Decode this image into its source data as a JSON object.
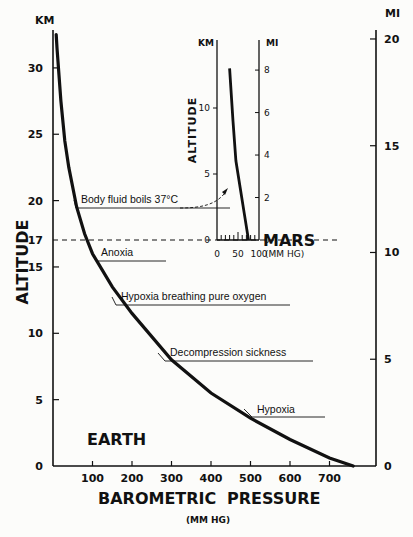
{
  "chart_data": {
    "type": "line",
    "title": "",
    "xlabel": "BAROMETRIC PRESSURE",
    "xlabel_units": "(MM HG)",
    "ylabel": "ALTITUDE",
    "ylabel_left_units": "KM",
    "ylabel_right_units": "MI",
    "xlim": [
      0,
      780
    ],
    "ylim_km": [
      0,
      33
    ],
    "x_ticks": [
      100,
      200,
      300,
      400,
      500,
      600,
      700
    ],
    "y_ticks_km": [
      0,
      5,
      10,
      15,
      17,
      20,
      25,
      30
    ],
    "y_ticks_mi": [
      0,
      5,
      10,
      15,
      20
    ],
    "grid": false,
    "legend": "none",
    "series": [
      {
        "name": "Earth",
        "x": [
          760,
          700,
          600,
          500,
          400,
          300,
          200,
          150,
          100,
          80,
          60,
          40,
          30,
          20,
          10,
          8
        ],
        "y": [
          0,
          0.6,
          2.0,
          3.6,
          5.5,
          8.0,
          11.5,
          13.5,
          16.0,
          17.5,
          19.5,
          22.5,
          24.5,
          27.5,
          31.5,
          32.5
        ]
      },
      {
        "name": "Mars",
        "x": [
          75,
          65,
          55,
          45,
          38,
          30
        ],
        "y": [
          0,
          2,
          4,
          6,
          9,
          13
        ]
      }
    ],
    "reference_lines": [
      {
        "label": "17",
        "orientation": "horizontal",
        "y_km": 17,
        "style": "dashed"
      }
    ],
    "annotations": [
      {
        "text": "Body fluid boils 37°C",
        "y_km": 19.3
      },
      {
        "text": "Anoxia",
        "y_km": 15.5
      },
      {
        "text": "Hypoxia breathing pure oxygen",
        "y_km": 12.2
      },
      {
        "text": "Decompression sickness",
        "y_km": 7.9
      },
      {
        "text": "Hypoxia",
        "y_km": 3.5
      }
    ],
    "region_labels": [
      "EARTH",
      "MARS"
    ],
    "inset": {
      "title": "Mars",
      "ylabel": "ALTITUDE",
      "ylabel_left_units": "KM",
      "ylabel_right_units": "MI",
      "x_ticks": [
        0,
        50,
        100
      ],
      "x_units": "(MM HG)",
      "y_ticks_km": [
        0,
        5,
        10
      ],
      "y_ticks_mi": [
        0,
        2,
        4,
        6,
        8
      ]
    }
  },
  "labels": {
    "km": "KM",
    "mi": "MI",
    "altitude": "ALTITUDE",
    "barometric": "BAROMETRIC",
    "pressure": "PRESSURE",
    "mmhg": "(MM HG)",
    "earth": "EARTH",
    "mars": "MARS",
    "inset_units": "(MM HG)"
  }
}
